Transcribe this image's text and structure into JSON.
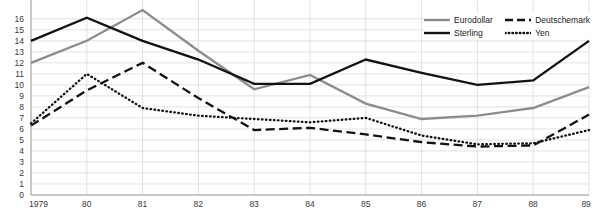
{
  "chart_data": {
    "type": "line",
    "title": "",
    "xlabel": "",
    "ylabel": "",
    "x": [
      "1979",
      "80",
      "81",
      "82",
      "83",
      "84",
      "85",
      "86",
      "87",
      "88",
      "89"
    ],
    "xlim": [
      0,
      10
    ],
    "ylim": [
      0,
      16.8
    ],
    "grid": true,
    "legend_position": "top-right",
    "yticks": [
      0,
      1,
      2,
      3,
      4,
      5,
      6,
      7,
      8,
      9,
      10,
      11,
      12,
      13,
      14,
      15,
      16
    ],
    "series": [
      {
        "name": "Eurodollar",
        "color": "#8c8c8c",
        "style": "solid",
        "values": [
          12.0,
          14.0,
          16.8,
          13.1,
          9.6,
          10.9,
          8.3,
          6.9,
          7.2,
          7.9,
          9.8
        ]
      },
      {
        "name": "Sterling",
        "color": "#121212",
        "style": "solid",
        "values": [
          14.0,
          16.1,
          14.0,
          12.3,
          10.1,
          10.1,
          12.3,
          11.1,
          10.0,
          10.4,
          14.0
        ]
      },
      {
        "name": "Deutschemark",
        "color": "#121212",
        "style": "dashed",
        "values": [
          6.3,
          9.5,
          12.0,
          8.8,
          5.9,
          6.1,
          5.5,
          4.8,
          4.4,
          4.5,
          7.3
        ]
      },
      {
        "name": "Yen",
        "color": "#121212",
        "style": "dotted",
        "values": [
          6.5,
          11.0,
          7.9,
          7.2,
          6.9,
          6.6,
          7.0,
          5.4,
          4.6,
          4.7,
          5.9
        ]
      }
    ]
  },
  "legend": {
    "items": [
      {
        "label": "Eurodollar"
      },
      {
        "label": "Deutschemark"
      },
      {
        "label": "Sterling"
      },
      {
        "label": "Yen"
      }
    ]
  },
  "axes": {
    "x_labels": [
      "1979",
      "80",
      "81",
      "82",
      "83",
      "84",
      "85",
      "86",
      "87",
      "88",
      "89"
    ],
    "y_labels": [
      "0",
      "1",
      "2",
      "3",
      "4",
      "5",
      "6",
      "7",
      "8",
      "9",
      "10",
      "11",
      "12",
      "13",
      "14",
      "15",
      "16"
    ]
  }
}
